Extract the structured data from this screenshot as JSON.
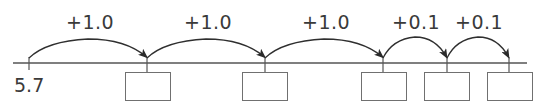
{
  "diagram": {
    "type": "number-line",
    "start": {
      "value": "5.7",
      "x": 29
    },
    "line": {
      "y": 63,
      "x1": 13,
      "x2": 527,
      "color": "#555555"
    },
    "ticks": [
      {
        "x": 29,
        "label": "5.7"
      },
      {
        "x": 147,
        "label": ""
      },
      {
        "x": 265,
        "label": ""
      },
      {
        "x": 383,
        "label": ""
      },
      {
        "x": 447,
        "label": ""
      },
      {
        "x": 509,
        "label": ""
      }
    ],
    "jumps": [
      {
        "label": "+1.0",
        "from_x": 29,
        "to_x": 147,
        "label_x": 66,
        "peak_y": 39
      },
      {
        "label": "+1.0",
        "from_x": 147,
        "to_x": 265,
        "label_x": 184,
        "peak_y": 39
      },
      {
        "label": "+1.0",
        "from_x": 265,
        "to_x": 383,
        "label_x": 302,
        "peak_y": 39
      },
      {
        "label": "+0.1",
        "from_x": 383,
        "to_x": 447,
        "label_x": 392,
        "peak_y": 37
      },
      {
        "label": "+0.1",
        "from_x": 447,
        "to_x": 509,
        "label_x": 455,
        "peak_y": 37
      }
    ],
    "answer_boxes": [
      {
        "x": 125,
        "width": 46,
        "value": ""
      },
      {
        "x": 242,
        "width": 46,
        "value": ""
      },
      {
        "x": 361,
        "width": 46,
        "value": ""
      },
      {
        "x": 424,
        "width": 46,
        "value": ""
      },
      {
        "x": 487,
        "width": 46,
        "value": ""
      }
    ],
    "colors": {
      "ink": "#3a3a3a",
      "line": "#555555",
      "box": "#707070"
    }
  }
}
